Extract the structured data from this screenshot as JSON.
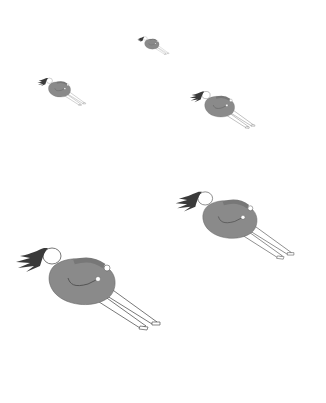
{
  "scene": {
    "background": "#ffffff",
    "description": "Five floating figures of a dark-haired person in a grey dress, tilted backward, of decreasing size",
    "colors": {
      "dress": "#8a8a8a",
      "hair": "#3a3a3a",
      "line": "#555555",
      "skin": "#ffffff"
    },
    "figures": [
      {
        "id": "large-bottom-left",
        "left": 12,
        "top": 236,
        "width": 155,
        "height": 95
      },
      {
        "id": "medium-right",
        "left": 172,
        "top": 182,
        "width": 128,
        "height": 78
      },
      {
        "id": "small-right",
        "left": 188,
        "top": 86,
        "width": 70,
        "height": 43
      },
      {
        "id": "small-left",
        "left": 36,
        "top": 74,
        "width": 52,
        "height": 32
      },
      {
        "id": "tiny-top",
        "left": 136,
        "top": 34,
        "width": 35,
        "height": 21
      }
    ]
  }
}
